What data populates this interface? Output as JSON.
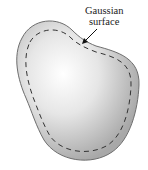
{
  "diagram": {
    "label_line1": "Gaussian",
    "label_line2": "surface",
    "colors": {
      "conductor_edge": "#8f8f8f",
      "conductor_center": "#f7f7f7",
      "dashed_line": "#333333",
      "background": "#ffffff"
    }
  }
}
